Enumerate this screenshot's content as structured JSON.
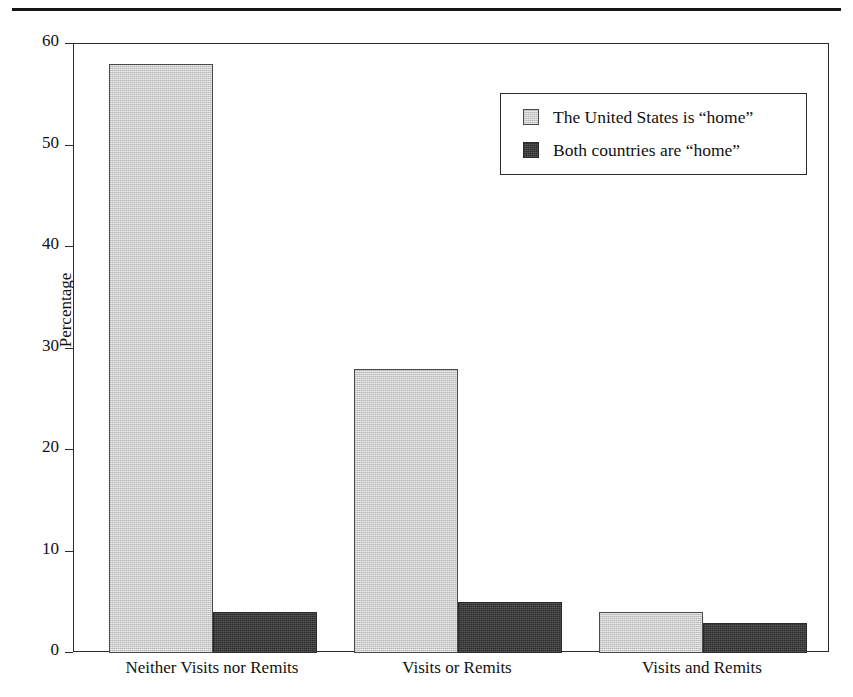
{
  "figure": {
    "top_rule_clipped_text": "",
    "background_color": "#ffffff",
    "frame_color": "#2b2b2b"
  },
  "legend": {
    "position": "inside-top-right",
    "entries": [
      {
        "label": "The United States is “home”",
        "color": "#cccccc",
        "swatch": "light-gray-square"
      },
      {
        "label": "Both countries are “home”",
        "color": "#3c3c3c",
        "swatch": "dark-gray-square"
      }
    ]
  },
  "chart_data": {
    "type": "bar",
    "title": "",
    "subtitle": "",
    "xlabel": "",
    "ylabel": "Percentage",
    "categories": [
      "Neither Visits nor Remits",
      "Visits or Remits",
      "Visits and Remits"
    ],
    "series": [
      {
        "name": "The United States is “home”",
        "color": "#cccccc",
        "values": [
          58,
          28,
          4
        ]
      },
      {
        "name": "Both countries are “home”",
        "color": "#3c3c3c",
        "values": [
          4,
          5,
          3
        ]
      }
    ],
    "ylim": [
      0,
      60
    ],
    "yticks": [
      0,
      10,
      20,
      30,
      40,
      50,
      60
    ],
    "ytick_labels": [
      "0",
      "10",
      "20",
      "30",
      "40",
      "50",
      "60"
    ],
    "grid": false,
    "legend_position": "upper right",
    "annotations": []
  }
}
